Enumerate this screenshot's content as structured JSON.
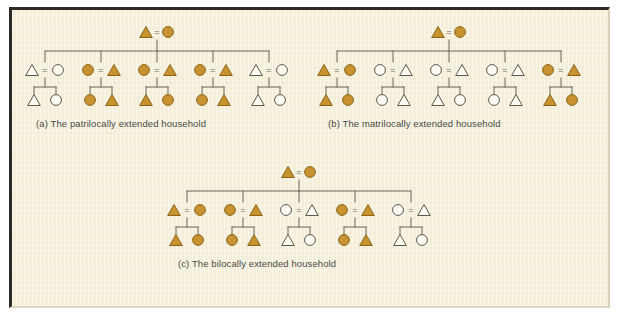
{
  "figure": {
    "background_color": "#f3ecd6",
    "frame_color": "#2b2a26",
    "line_color": "#6b6456",
    "fill_color": "#c8922f",
    "fill_stroke_color": "#8a6418",
    "open_fill_color": "#fdfbf3",
    "open_stroke_color": "#5d564a",
    "text_color": "#4a4a46"
  },
  "panels": [
    {
      "id": "a",
      "caption": "(a) The patrilocally extended household",
      "top_couple": {
        "left": "filled-triangle",
        "right": "filled-circle",
        "link": "="
      },
      "families": [
        {
          "couple": {
            "left": "open-triangle",
            "right": "open-circle",
            "link": "="
          },
          "children": [
            "open-triangle",
            "open-circle"
          ]
        },
        {
          "couple": {
            "left": "filled-circle",
            "right": "filled-triangle",
            "link": "="
          },
          "children": [
            "filled-circle",
            "filled-triangle"
          ]
        },
        {
          "couple": {
            "left": "filled-circle",
            "right": "filled-triangle",
            "link": "="
          },
          "children": [
            "filled-triangle",
            "filled-circle"
          ]
        },
        {
          "couple": {
            "left": "filled-circle",
            "right": "filled-triangle",
            "link": "="
          },
          "children": [
            "filled-circle",
            "filled-triangle"
          ]
        },
        {
          "couple": {
            "left": "open-triangle",
            "right": "open-circle",
            "link": "="
          },
          "children": [
            "open-triangle",
            "open-circle"
          ]
        }
      ]
    },
    {
      "id": "b",
      "caption": "(b) The matrilocally extended household",
      "top_couple": {
        "left": "filled-triangle",
        "right": "filled-circle",
        "link": "="
      },
      "families": [
        {
          "couple": {
            "left": "filled-triangle",
            "right": "filled-circle",
            "link": "="
          },
          "children": [
            "filled-triangle",
            "filled-circle"
          ]
        },
        {
          "couple": {
            "left": "open-circle",
            "right": "open-triangle",
            "link": "="
          },
          "children": [
            "open-circle",
            "open-triangle"
          ]
        },
        {
          "couple": {
            "left": "open-circle",
            "right": "open-triangle",
            "link": "="
          },
          "children": [
            "open-triangle",
            "open-circle"
          ]
        },
        {
          "couple": {
            "left": "open-circle",
            "right": "open-triangle",
            "link": "="
          },
          "children": [
            "open-circle",
            "open-triangle"
          ]
        },
        {
          "couple": {
            "left": "filled-circle",
            "right": "filled-triangle",
            "link": "="
          },
          "children": [
            "filled-triangle",
            "filled-circle"
          ]
        }
      ]
    },
    {
      "id": "c",
      "caption": "(c) The bilocally extended household",
      "top_couple": {
        "left": "filled-triangle",
        "right": "filled-circle",
        "link": "="
      },
      "families": [
        {
          "couple": {
            "left": "filled-triangle",
            "right": "filled-circle",
            "link": "="
          },
          "children": [
            "filled-triangle",
            "filled-circle"
          ]
        },
        {
          "couple": {
            "left": "filled-circle",
            "right": "filled-triangle",
            "link": "="
          },
          "children": [
            "filled-circle",
            "filled-triangle"
          ]
        },
        {
          "couple": {
            "left": "open-circle",
            "right": "open-triangle",
            "link": "="
          },
          "children": [
            "open-triangle",
            "open-circle"
          ]
        },
        {
          "couple": {
            "left": "filled-circle",
            "right": "filled-triangle",
            "link": "="
          },
          "children": [
            "filled-circle",
            "filled-triangle"
          ]
        },
        {
          "couple": {
            "left": "open-circle",
            "right": "open-triangle",
            "link": "="
          },
          "children": [
            "open-triangle",
            "open-circle"
          ]
        }
      ]
    }
  ]
}
